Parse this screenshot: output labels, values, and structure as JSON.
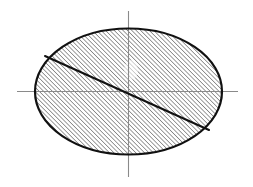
{
  "figure": {
    "canvas": {
      "width": 253,
      "height": 187,
      "background": "#ffffff"
    },
    "ellipse": {
      "name": "cross-section outline",
      "center_x": 128.5,
      "center_y": 91.5,
      "radius_x": 93.5,
      "radius_y": 63.0,
      "left_x": 35,
      "right_x": 222,
      "top_y": 29,
      "bottom_y": 155,
      "stroke_color": "#111111",
      "stroke_width": 2.2,
      "fill": "none"
    },
    "hatch": {
      "name": "section hatching",
      "angle_degrees": 45,
      "direction": "lower-left to upper-right",
      "spacing_px": 3.1,
      "line_width": 0.85,
      "color": "#1a1a1a"
    },
    "axes": {
      "color": "#8a8a8a",
      "line_width": 1.1,
      "horizontal": {
        "label": "horizontal centre line",
        "x1": 17,
        "y1": 91.5,
        "x2": 238,
        "y2": 91.5
      },
      "vertical": {
        "label": "vertical centre line",
        "x1": 128.5,
        "y1": 11,
        "x2": 128.5,
        "y2": 177
      }
    },
    "chord": {
      "name": "diagonal chord",
      "x1": 45,
      "y1": 56,
      "x2": 209,
      "y2": 130,
      "stroke_color": "#111111",
      "stroke_width": 2.0,
      "passes_through_center": true
    },
    "highlight": {
      "name": "faded spot",
      "cx": 131,
      "cy": 70,
      "rx": 7,
      "ry": 10,
      "color": "#ffffff",
      "opacity": 0.55
    }
  }
}
